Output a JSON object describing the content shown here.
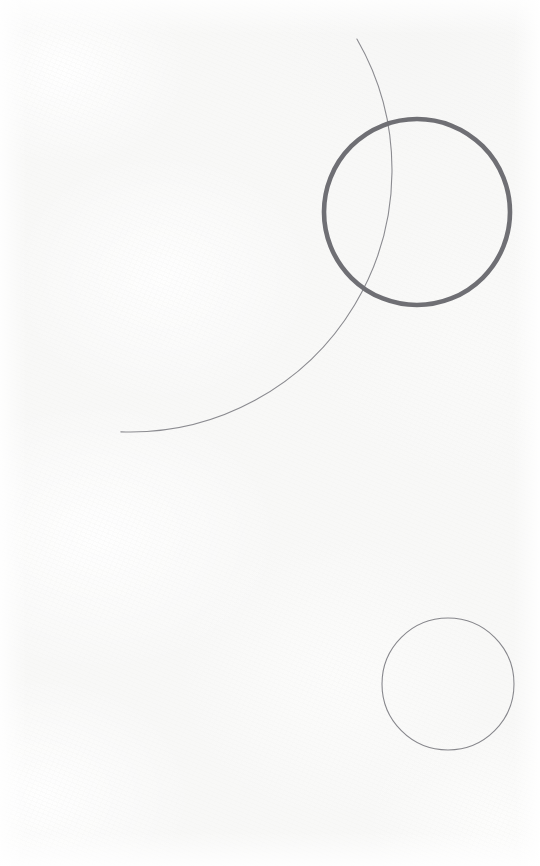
{
  "canvas": {
    "width": 540,
    "height": 866,
    "background_color": "#f8f8f7",
    "description": "Abstract minimal line drawing on off-white paper: three circular forms"
  },
  "palette": {
    "paper": "#f8f8f7",
    "paper_highlight": "#ffffff",
    "thick_stroke": "#6f6f74",
    "thin_stroke": "#8b8b90",
    "small_circle_stroke": "#87878c"
  },
  "shapes": [
    {
      "id": "large-arc",
      "name": "large-thin-arc",
      "type": "arc",
      "center_x": 130,
      "center_y": 170,
      "radius": 262,
      "stroke_color": "#8b8b90",
      "stroke_width": 1.1,
      "start_angle_deg": -30,
      "end_angle_deg": 92,
      "note": "Thin sweeping arc entering top edge near x=292 and exiting left edge near y=455"
    },
    {
      "id": "bold-circle",
      "name": "bold-circle",
      "type": "circle",
      "center_x": 417,
      "center_y": 212,
      "radius": 93,
      "stroke_color": "#6f6f74",
      "stroke_width": 4.6,
      "fill": "none",
      "note": "Heavy outlined circle in the upper right, overlapped by the thin arc"
    },
    {
      "id": "small-circle",
      "name": "small-circle",
      "type": "circle",
      "center_x": 448,
      "center_y": 684,
      "radius": 66,
      "stroke_color": "#87878c",
      "stroke_width": 1.1,
      "fill": "none",
      "note": "Fine outlined circle in the lower right"
    }
  ]
}
